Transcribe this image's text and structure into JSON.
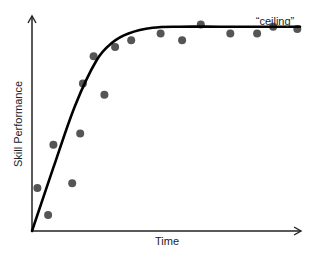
{
  "chart_data": {
    "type": "scatter",
    "title": "",
    "xlabel": "Time",
    "ylabel": "Skill Performance",
    "annotations": [
      {
        "text": "“ceiling”",
        "x": 0.92,
        "y": 0.93
      }
    ],
    "grid": false,
    "legend": null,
    "xlim": [
      0,
      1
    ],
    "ylim": [
      0,
      1
    ],
    "x_ticks": [],
    "y_ticks": [],
    "series": [
      {
        "name": "observations",
        "type": "scatter",
        "points": [
          [
            0.02,
            0.19
          ],
          [
            0.06,
            0.07
          ],
          [
            0.08,
            0.38
          ],
          [
            0.15,
            0.21
          ],
          [
            0.18,
            0.43
          ],
          [
            0.19,
            0.65
          ],
          [
            0.23,
            0.77
          ],
          [
            0.27,
            0.6
          ],
          [
            0.31,
            0.81
          ],
          [
            0.37,
            0.84
          ],
          [
            0.48,
            0.87
          ],
          [
            0.56,
            0.84
          ],
          [
            0.63,
            0.91
          ],
          [
            0.74,
            0.87
          ],
          [
            0.84,
            0.87
          ],
          [
            0.9,
            0.9
          ],
          [
            0.99,
            0.89
          ]
        ]
      },
      {
        "name": "fitted curve",
        "type": "line",
        "points": [
          [
            0.0,
            0.0
          ],
          [
            0.08,
            0.28
          ],
          [
            0.16,
            0.55
          ],
          [
            0.24,
            0.75
          ],
          [
            0.3,
            0.83
          ],
          [
            0.36,
            0.87
          ],
          [
            0.45,
            0.895
          ],
          [
            0.55,
            0.9
          ],
          [
            0.7,
            0.9
          ],
          [
            0.85,
            0.9
          ],
          [
            1.0,
            0.9
          ]
        ]
      }
    ]
  },
  "labels": {
    "x_axis": "Time",
    "y_axis": "Skill Performance",
    "ceiling": "“ceiling”"
  },
  "colors": {
    "axis": "#222222",
    "curve": "#000000",
    "dots": "#555555"
  }
}
